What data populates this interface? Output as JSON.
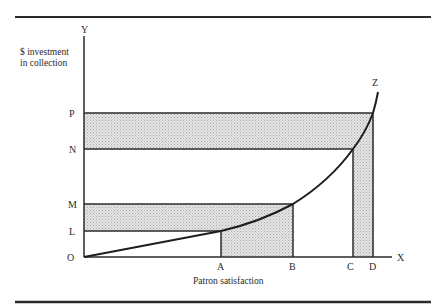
{
  "diagram": {
    "y_axis": {
      "letter": "Y",
      "title_line1": "$ investment",
      "title_line2": "in collection"
    },
    "x_axis": {
      "letter": "X",
      "title": "Patron satisfaction"
    },
    "origin_label": "O",
    "curve_label": "Z",
    "y_points": [
      {
        "label": "P",
        "y": 113
      },
      {
        "label": "N",
        "y": 149
      },
      {
        "label": "M",
        "y": 204
      },
      {
        "label": "L",
        "y": 231
      }
    ],
    "x_points": [
      {
        "label": "A",
        "x": 221
      },
      {
        "label": "B",
        "x": 293
      },
      {
        "label": "C",
        "x": 353
      },
      {
        "label": "D",
        "x": 373
      }
    ],
    "colors": {
      "line": "#2a2a2a",
      "shade": "#d9d9d9",
      "background": "#ffffff"
    }
  }
}
